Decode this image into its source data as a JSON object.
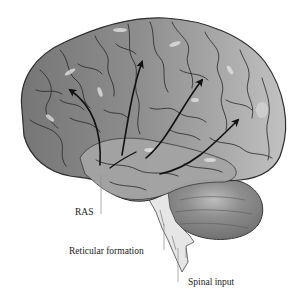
{
  "diagram": {
    "labels": {
      "ras": "RAS",
      "reticular_formation": "Reticular formation",
      "spinal_input": "Spinal input"
    },
    "arrows": {
      "count": 5,
      "direction": "from brainstem upward into cerebral cortex"
    },
    "regions": [
      "cerebral-cortex",
      "temporal-lobe",
      "cerebellum",
      "brainstem"
    ],
    "colors": {
      "frontal": "#7a7a7a",
      "parietal": "#9a9a9a",
      "occipital": "#b8b8b8",
      "temporal": "#a6a6a6",
      "cerebellum": "#8c8c8c",
      "brainstem": "#e4e4e4",
      "sulci": "#2a2a2a",
      "arrow": "#111111"
    }
  }
}
